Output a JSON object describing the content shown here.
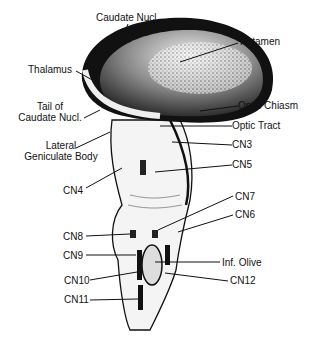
{
  "diagram": {
    "type": "anatomical-illustration",
    "labels": {
      "caudate": "Caudate Nucl.",
      "putamen": "Putamen",
      "thalamus": "Thalamus",
      "tail_line1": "Tail of",
      "tail_line2": "Caudate Nucl.",
      "optic_chiasm": "Optic Chiasm",
      "optic_tract": "Optic Tract",
      "lgb_line1": "Lateral",
      "lgb_line2": "Geniculate Body",
      "cn3": "CN3",
      "cn5": "CN5",
      "cn4": "CN4",
      "cn7": "CN7",
      "cn6": "CN6",
      "cn8": "CN8",
      "cn9": "CN9",
      "inf_olive": "Inf. Olive",
      "cn10": "CN10",
      "cn12": "CN12",
      "cn11": "CN11"
    }
  }
}
